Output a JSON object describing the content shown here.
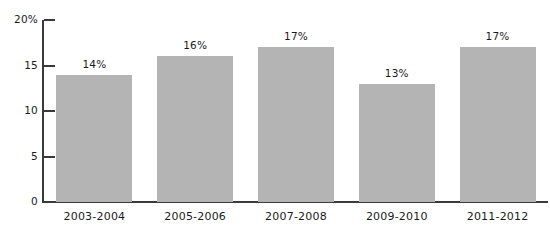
{
  "chart_data": {
    "type": "bar",
    "title": "",
    "subtitle": "",
    "xlabel": "",
    "ylabel": "",
    "categories": [
      "2003-2004",
      "2005-2006",
      "2007-2008",
      "2009-2010",
      "2011-2012"
    ],
    "values": [
      14,
      16,
      17,
      13,
      17
    ],
    "value_labels": [
      "14%",
      "16%",
      "17%",
      "13%",
      "17%"
    ],
    "ylim": [
      0,
      20
    ],
    "yticks": [
      0,
      5,
      10,
      15,
      20
    ],
    "ytick_labels": [
      "0",
      "5",
      "10",
      "15",
      "20%"
    ],
    "grid": false,
    "legend": false,
    "legend_position": "none",
    "bar_color": "#b4b4b4",
    "axis_color": "#3a3a3a",
    "text_color": "#1a1a1a",
    "background_color": "#ffffff"
  }
}
